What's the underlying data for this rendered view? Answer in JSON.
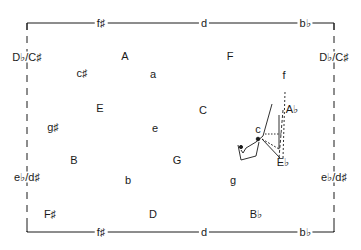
{
  "diagram": {
    "type": "tonnetz-key-map",
    "frame": {
      "top_labels": [
        "f♯",
        "d",
        "b♭"
      ],
      "bottom_labels": [
        "f♯",
        "d",
        "b♭"
      ],
      "left_labels": [
        "D♭/C♯",
        "e♭/d♯"
      ],
      "right_labels": [
        "D♭/C♯",
        "e♭/d♯"
      ]
    },
    "keys": [
      {
        "id": "A",
        "label": "A",
        "x": 125,
        "y": 56
      },
      {
        "id": "F",
        "label": "F",
        "x": 230,
        "y": 56
      },
      {
        "id": "c-sharp",
        "label": "c♯",
        "x": 82,
        "y": 73
      },
      {
        "id": "a",
        "label": "a",
        "x": 153,
        "y": 74
      },
      {
        "id": "f",
        "label": "f",
        "x": 284,
        "y": 75
      },
      {
        "id": "E",
        "label": "E",
        "x": 100,
        "y": 108
      },
      {
        "id": "C",
        "label": "C",
        "x": 203,
        "y": 110
      },
      {
        "id": "A-flat",
        "label": "A♭",
        "x": 292,
        "y": 109
      },
      {
        "id": "g-sharp",
        "label": "g♯",
        "x": 53,
        "y": 127
      },
      {
        "id": "e",
        "label": "e",
        "x": 155,
        "y": 128
      },
      {
        "id": "c",
        "label": "c",
        "x": 258,
        "y": 129
      },
      {
        "id": "B",
        "label": "B",
        "x": 74,
        "y": 160
      },
      {
        "id": "G",
        "label": "G",
        "x": 177,
        "y": 160
      },
      {
        "id": "E-flat",
        "label": "E♭",
        "x": 283,
        "y": 162
      },
      {
        "id": "b",
        "label": "b",
        "x": 128,
        "y": 180
      },
      {
        "id": "g",
        "label": "g",
        "x": 233,
        "y": 180
      },
      {
        "id": "F-sharp",
        "label": "F♯",
        "x": 50,
        "y": 214
      },
      {
        "id": "D",
        "label": "D",
        "x": 153,
        "y": 214
      },
      {
        "id": "B-flat",
        "label": "B♭",
        "x": 256,
        "y": 214
      }
    ],
    "colors": {
      "ink": "#1a1a1a",
      "paper": "#ffffff"
    }
  }
}
